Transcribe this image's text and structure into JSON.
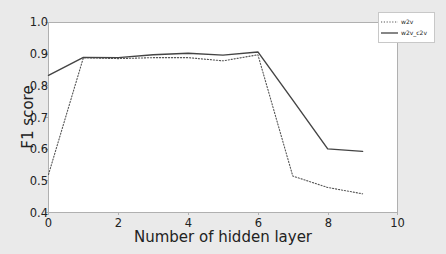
{
  "chart_data": {
    "type": "line",
    "title": "",
    "subtitle": "",
    "xlabel": "Number of hidden layer",
    "ylabel": "F1 score",
    "xlim": [
      0,
      10
    ],
    "ylim": [
      0.4,
      1.0
    ],
    "xticks": [
      0,
      2,
      4,
      6,
      8,
      10
    ],
    "xtick_labels": [
      "0",
      "2",
      "4",
      "6",
      "8",
      "10"
    ],
    "yticks": [
      0.4,
      0.5,
      0.6,
      0.7,
      0.8,
      0.9,
      1.0
    ],
    "ytick_labels": [
      "0.4",
      "0.5",
      "0.6",
      "0.7",
      "0.8",
      "0.9",
      "1.0"
    ],
    "grid": false,
    "legend_position": "upper right",
    "x": [
      0,
      1,
      2,
      3,
      4,
      5,
      6,
      7,
      8,
      9
    ],
    "series": [
      {
        "name": "w2v",
        "style": "dotted",
        "color": "#555555",
        "values": [
          0.52,
          0.889,
          0.886,
          0.889,
          0.889,
          0.879,
          0.898,
          0.515,
          0.479,
          0.459
        ]
      },
      {
        "name": "w2v_c2v",
        "style": "solid",
        "color": "#444444",
        "values": [
          0.833,
          0.89,
          0.889,
          0.898,
          0.903,
          0.897,
          0.907,
          0.755,
          0.601,
          0.593
        ]
      }
    ],
    "annotations": []
  },
  "legend": {
    "entries": [
      {
        "label": "w2v",
        "style": "dotted"
      },
      {
        "label": "w2v_c2v",
        "style": "solid"
      }
    ]
  },
  "colors": {
    "figure_background": "#eaeaea",
    "axes_background": "#ffffff",
    "axis_line": "#b0b0b0",
    "text": "#222222",
    "series_w2v": "#555555",
    "series_w2v_c2v": "#444444"
  }
}
